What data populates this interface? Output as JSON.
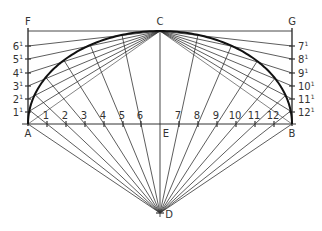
{
  "diagram": {
    "type": "geometric-construction",
    "cropped_top_text": "",
    "colors": {
      "line": "#333333",
      "arc": "#111111",
      "background": "#ffffff",
      "label": "#333333"
    },
    "points": {
      "A": {
        "label": "A",
        "x": 28,
        "y": 124
      },
      "B": {
        "label": "B",
        "x": 292,
        "y": 124
      },
      "C": {
        "label": "C",
        "x": 160,
        "y": 31
      },
      "D": {
        "label": "D",
        "x": 160,
        "y": 213
      },
      "E": {
        "label": "E",
        "x": 160,
        "y": 124
      },
      "F": {
        "label": "F",
        "x": 28,
        "y": 31
      },
      "G": {
        "label": "G",
        "x": 292,
        "y": 31
      }
    },
    "baseline_divisions": [
      {
        "label": "1",
        "x": 47
      },
      {
        "label": "2",
        "x": 66
      },
      {
        "label": "3",
        "x": 85
      },
      {
        "label": "4",
        "x": 104
      },
      {
        "label": "5",
        "x": 123
      },
      {
        "label": "6",
        "x": 141
      },
      {
        "label": "7",
        "x": 179
      },
      {
        "label": "8",
        "x": 198
      },
      {
        "label": "9",
        "x": 217
      },
      {
        "label": "10",
        "x": 236
      },
      {
        "label": "11",
        "x": 255
      },
      {
        "label": "12",
        "x": 274
      }
    ],
    "left_side_divisions": [
      {
        "label": "6",
        "prime": "1",
        "y": 46
      },
      {
        "label": "5",
        "prime": "1",
        "y": 59
      },
      {
        "label": "4",
        "prime": "1",
        "y": 73
      },
      {
        "label": "3",
        "prime": "1",
        "y": 86
      },
      {
        "label": "2",
        "prime": "1",
        "y": 99
      },
      {
        "label": "1",
        "prime": "1",
        "y": 112
      }
    ],
    "right_side_divisions": [
      {
        "label": "7",
        "prime": "1",
        "y": 46
      },
      {
        "label": "8",
        "prime": "1",
        "y": 59
      },
      {
        "label": "9",
        "prime": "1",
        "y": 73
      },
      {
        "label": "10",
        "prime": "1",
        "y": 86
      },
      {
        "label": "11",
        "prime": "1",
        "y": 99
      },
      {
        "label": "12",
        "prime": "1",
        "y": 112
      }
    ]
  }
}
